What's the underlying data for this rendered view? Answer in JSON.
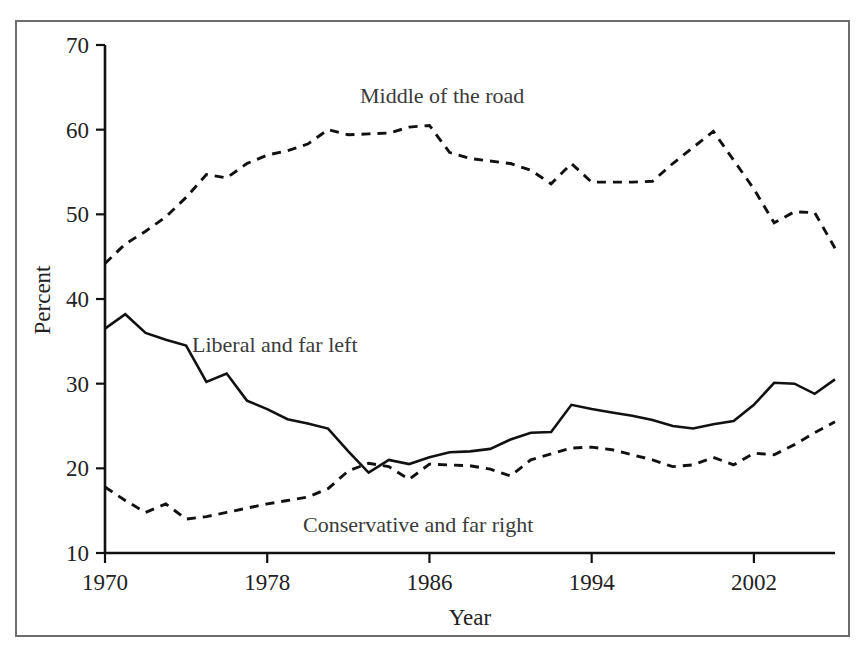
{
  "chart_data": {
    "type": "line",
    "title": "",
    "subtitle": "",
    "xlabel": "Year",
    "ylabel": "Percent",
    "xlim": [
      1970,
      2006
    ],
    "ylim": [
      10,
      70
    ],
    "xticks": [
      1970,
      1978,
      1986,
      1994,
      2002
    ],
    "xtick_labels": [
      "1970",
      "1978",
      "1986",
      "1994",
      "2002"
    ],
    "yticks": [
      10,
      20,
      30,
      40,
      50,
      60,
      70
    ],
    "ytick_labels": [
      "10",
      "20",
      "30",
      "40",
      "50",
      "60",
      "70"
    ],
    "grid": false,
    "legend_position": "inline-annotations",
    "x": [
      1970,
      1971,
      1972,
      1973,
      1974,
      1975,
      1976,
      1977,
      1978,
      1979,
      1980,
      1981,
      1982,
      1983,
      1984,
      1985,
      1986,
      1987,
      1988,
      1989,
      1990,
      1991,
      1992,
      1993,
      1994,
      1995,
      1996,
      1997,
      1998,
      1999,
      2000,
      2001,
      2002,
      2003,
      2004,
      2005,
      2006
    ],
    "series": [
      {
        "name": "Middle of the road",
        "style": "dashed",
        "color": "#111111",
        "values": [
          44.2,
          46.5,
          48.0,
          49.7,
          52.0,
          54.7,
          54.3,
          56.0,
          57.0,
          57.5,
          58.3,
          60.0,
          59.4,
          59.5,
          59.6,
          60.3,
          60.5,
          57.3,
          56.6,
          56.3,
          56.0,
          55.2,
          53.6,
          56.0,
          53.8,
          53.8,
          53.8,
          53.9,
          56.0,
          57.9,
          59.8,
          56.4,
          53.0,
          49.0,
          50.3,
          50.2,
          46.0
        ]
      },
      {
        "name": "Liberal and far left",
        "style": "solid",
        "color": "#111111",
        "values": [
          36.5,
          38.2,
          36.0,
          35.2,
          34.5,
          30.2,
          31.2,
          28.0,
          27.0,
          25.8,
          25.3,
          24.7,
          22.0,
          19.5,
          21.0,
          20.5,
          21.3,
          21.9,
          22.0,
          22.3,
          23.4,
          24.2,
          24.3,
          27.5,
          27.0,
          26.6,
          26.2,
          25.7,
          25.0,
          24.7,
          25.2,
          25.6,
          27.5,
          30.1,
          30.0,
          28.8,
          30.5
        ]
      },
      {
        "name": "Conservative and far right",
        "style": "dashed",
        "color": "#111111",
        "values": [
          17.8,
          16.2,
          14.8,
          15.8,
          14.0,
          14.3,
          14.8,
          15.3,
          15.8,
          16.2,
          16.6,
          17.6,
          19.7,
          20.6,
          20.2,
          18.7,
          20.5,
          20.4,
          20.3,
          19.9,
          19.1,
          21.0,
          21.7,
          22.4,
          22.5,
          22.2,
          21.6,
          21.0,
          20.2,
          20.4,
          21.3,
          20.4,
          21.8,
          21.6,
          22.8,
          24.2,
          25.5
        ]
      }
    ],
    "annotations": [
      {
        "text": "Middle of the road",
        "x": 360,
        "y": 103
      },
      {
        "text": "Liberal and far left",
        "x": 192,
        "y": 352
      },
      {
        "text": "Conservative and far right",
        "x": 303,
        "y": 532
      }
    ]
  }
}
